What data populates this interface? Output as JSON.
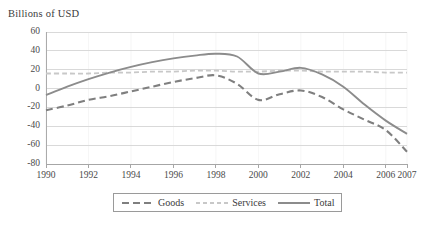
{
  "chart_data": {
    "type": "line",
    "title": "",
    "ylabel": "Billions of USD",
    "xlabel": "",
    "grid": true,
    "legend_position": "bottom",
    "ylim": [
      -80,
      60
    ],
    "yticks": [
      60,
      40,
      20,
      0,
      -20,
      -40,
      -60,
      -80
    ],
    "ytick_labels": [
      "60",
      "40",
      "20",
      "0",
      "-20",
      "-40",
      "-60",
      "-80"
    ],
    "xlim": [
      1990,
      2007
    ],
    "xticks": [
      1990,
      1992,
      1994,
      1996,
      1998,
      2000,
      2002,
      2004,
      2006,
      2007
    ],
    "xtick_labels": [
      "1990",
      "1992",
      "1994",
      "1996",
      "1998",
      "2000",
      "2002",
      "2004",
      "2006",
      "2007"
    ],
    "x": [
      1990,
      1991,
      1992,
      1993,
      1994,
      1995,
      1996,
      1997,
      1998,
      1999,
      2000,
      2001,
      2002,
      2003,
      2004,
      2005,
      2006,
      2007
    ],
    "series": [
      {
        "name": "Goods",
        "style": "dashed",
        "color": "#7f7f7f",
        "values": [
          -23,
          -18,
          -12,
          -8,
          -3,
          2,
          7,
          11,
          14,
          5,
          -12,
          -6,
          -2,
          -9,
          -22,
          -33,
          -44,
          -67
        ]
      },
      {
        "name": "Services",
        "style": "dashed-light",
        "color": "#c8c8c8",
        "values": [
          16,
          16,
          16,
          17,
          17,
          18,
          18,
          19,
          19,
          18,
          18,
          19,
          19,
          18,
          18,
          18,
          17,
          17
        ]
      },
      {
        "name": "Total",
        "style": "solid",
        "color": "#8c8c8c",
        "values": [
          -7,
          2,
          10,
          17,
          23,
          28,
          32,
          35,
          37,
          34,
          16,
          18,
          22,
          15,
          2,
          -17,
          -34,
          -48
        ]
      }
    ]
  },
  "legend": {
    "items": [
      {
        "label": "Goods",
        "swatch": "dashed-dark-swatch"
      },
      {
        "label": "Services",
        "swatch": "dashed-light-swatch"
      },
      {
        "label": "Total",
        "swatch": "solid-gray-swatch"
      }
    ]
  },
  "colors": {
    "goods": "#7f7f7f",
    "services": "#c8c8c8",
    "total": "#8c8c8c",
    "grid": "#d9d9d9",
    "axis": "#a6a6a6",
    "text": "#3b3b3b"
  }
}
